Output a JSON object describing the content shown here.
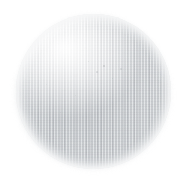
{
  "scene": {
    "width": 185,
    "height": 181,
    "background_color": "#ffffff",
    "description": "Close-up photograph of a pale off-white round textured disc (plate) centred on a plain white background",
    "alt_text": "White circular textured disc on white background"
  },
  "subject": {
    "name": "circular-disc",
    "shape": "circle",
    "center_x": 93,
    "center_y": 91,
    "diameter_px": 155,
    "body_color": "#e5e7e9",
    "shadow_color": "#d5d8db",
    "highlight_color": "#ffffff",
    "rim_color": "#f4f5f6",
    "texture": "fine vertical ribbed weave",
    "highlight_position": "upper-left",
    "shading_position": "lower-center"
  },
  "specks": [
    {
      "x": 104,
      "y": 66,
      "size": 1.4,
      "opacity": 0.5
    },
    {
      "x": 97,
      "y": 72,
      "size": 1.1,
      "opacity": 0.38
    },
    {
      "x": 112,
      "y": 78,
      "size": 1.0,
      "opacity": 0.32
    },
    {
      "x": 88,
      "y": 61,
      "size": 1.0,
      "opacity": 0.3
    },
    {
      "x": 121,
      "y": 69,
      "size": 1.2,
      "opacity": 0.34
    },
    {
      "x": 75,
      "y": 95,
      "size": 0.9,
      "opacity": 0.26
    },
    {
      "x": 60,
      "y": 112,
      "size": 1.0,
      "opacity": 0.24
    },
    {
      "x": 131,
      "y": 104,
      "size": 0.9,
      "opacity": 0.22
    },
    {
      "x": 46,
      "y": 84,
      "size": 0.9,
      "opacity": 0.22
    },
    {
      "x": 108,
      "y": 128,
      "size": 1.0,
      "opacity": 0.2
    }
  ]
}
